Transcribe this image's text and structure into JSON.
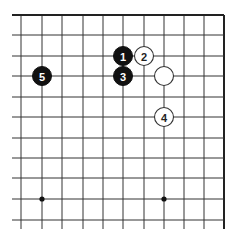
{
  "diagram": {
    "type": "go-board-fragment",
    "grid": {
      "x_lines": [
        21,
        42,
        62,
        83,
        103,
        123,
        144,
        164,
        184,
        204,
        224
      ],
      "y_lines": [
        15,
        35,
        56,
        76,
        97,
        117,
        138,
        158,
        178,
        199,
        220
      ],
      "top_edge_y": 15,
      "right_edge_x": 224,
      "left_extent": 12,
      "bottom_extent": 229
    },
    "hoshi": [
      {
        "x": 42,
        "y": 199
      },
      {
        "x": 164,
        "y": 199
      }
    ],
    "stones": [
      {
        "color": "black",
        "label": "1",
        "x": 123,
        "y": 56
      },
      {
        "color": "white",
        "label": "2",
        "x": 144,
        "y": 56
      },
      {
        "color": "black",
        "label": "3",
        "x": 123,
        "y": 76
      },
      {
        "color": "white",
        "label": "",
        "x": 164,
        "y": 76
      },
      {
        "color": "white",
        "label": "4",
        "x": 164,
        "y": 117
      },
      {
        "color": "black",
        "label": "5",
        "x": 42,
        "y": 76
      }
    ],
    "stone_radius": 9.5
  }
}
